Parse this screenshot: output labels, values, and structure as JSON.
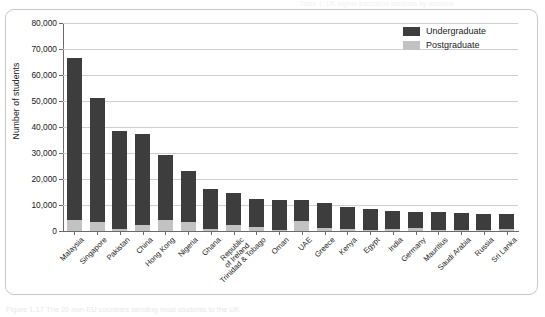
{
  "figure": {
    "running_head": "Table 1: UK higher education students by domicile",
    "caption": "Figure 1.17  The 20 non-EU countries sending most students to the UK"
  },
  "chart_data": {
    "type": "bar",
    "stacked": true,
    "title": "",
    "xlabel": "",
    "ylabel": "Number of students",
    "ylim": [
      0,
      80000
    ],
    "ytick_labels": [
      "80,000",
      "70,000",
      "60,000",
      "50,000",
      "40,000",
      "30,000",
      "20,000",
      "10,000",
      "0"
    ],
    "ytick_values": [
      80000,
      70000,
      60000,
      50000,
      40000,
      30000,
      20000,
      10000,
      0
    ],
    "grid": true,
    "legend_position": "top-right",
    "categories": [
      "Malaysia",
      "Singapore",
      "Pakistan",
      "China",
      "Hong Kong",
      "Nigeria",
      "Ghana",
      "Republic\nof Ireland",
      "Trinidad & Tobago",
      "Oman",
      "UAE",
      "Greece",
      "Kenya",
      "Egypt",
      "India",
      "Germany",
      "Mauritius",
      "Saudi Arabia",
      "Russia",
      "Sri Lanka"
    ],
    "series": [
      {
        "name": "Postgraduate",
        "color": "#c2c2c2",
        "values": [
          4100,
          3500,
          600,
          2400,
          4100,
          3500,
          700,
          2300,
          1400,
          500,
          4000,
          1300,
          600,
          400,
          900,
          1000,
          300,
          400,
          400,
          600
        ]
      },
      {
        "name": "Undergraduate",
        "color": "#3d3d3d",
        "values": [
          62400,
          47800,
          37700,
          34800,
          25200,
          19400,
          15500,
          12200,
          10800,
          11400,
          7800,
          9300,
          8600,
          8100,
          6800,
          6300,
          7000,
          6500,
          6200,
          5800
        ]
      }
    ],
    "totals": [
      66500,
      51300,
      38300,
      37200,
      29300,
      22900,
      16200,
      14500,
      12200,
      11900,
      11800,
      10600,
      9200,
      8500,
      7700,
      7300,
      7300,
      6900,
      6600,
      6400
    ]
  },
  "legend": {
    "items": [
      {
        "label": "Undergraduate",
        "color": "#3d3d3d"
      },
      {
        "label": "Postgraduate",
        "color": "#c2c2c2"
      }
    ]
  }
}
